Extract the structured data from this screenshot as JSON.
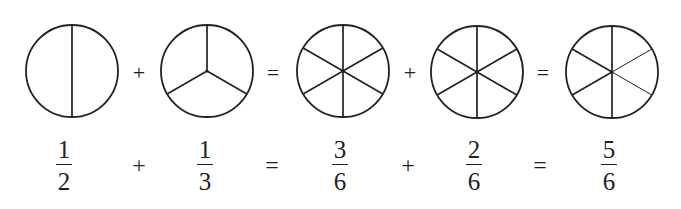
{
  "diagram": {
    "stroke_color": "#222222",
    "background": "#ffffff",
    "circles": [
      {
        "id": "one-half",
        "cx": 72,
        "cy": 71,
        "r": 46,
        "parts": 2,
        "spokes_thick": [
          90,
          270
        ],
        "spokes_thin": []
      },
      {
        "id": "one-third",
        "cx": 207,
        "cy": 71,
        "r": 46,
        "parts": 3,
        "spokes_thick": [
          270,
          30,
          150
        ],
        "spokes_thin": []
      },
      {
        "id": "three-sixths",
        "cx": 343,
        "cy": 71,
        "r": 46,
        "parts": 6,
        "spokes_thick": [
          270,
          330,
          30,
          90,
          150,
          210
        ],
        "spokes_thin": []
      },
      {
        "id": "two-sixths",
        "cx": 477,
        "cy": 72,
        "r": 46,
        "parts": 6,
        "spokes_thick": [
          270,
          330,
          30,
          90,
          150,
          210
        ],
        "spokes_thin": []
      },
      {
        "id": "five-sixths",
        "cx": 612,
        "cy": 72,
        "r": 46,
        "parts": 6,
        "spokes_thick": [
          270,
          90,
          150,
          210
        ],
        "spokes_thin": [
          330,
          30
        ]
      }
    ],
    "top_operators": [
      {
        "symbol": "+",
        "x": 139,
        "y": 80
      },
      {
        "symbol": "=",
        "x": 273,
        "y": 80
      },
      {
        "symbol": "+",
        "x": 410,
        "y": 80
      },
      {
        "symbol": "=",
        "x": 543,
        "y": 80
      }
    ],
    "fractions": [
      {
        "numerator": "1",
        "denominator": "2",
        "x": 64
      },
      {
        "numerator": "1",
        "denominator": "3",
        "x": 205
      },
      {
        "numerator": "3",
        "denominator": "6",
        "x": 340
      },
      {
        "numerator": "2",
        "denominator": "6",
        "x": 474
      },
      {
        "numerator": "5",
        "denominator": "6",
        "x": 609
      }
    ],
    "bottom_operators": [
      {
        "symbol": "+",
        "x": 139
      },
      {
        "symbol": "=",
        "x": 272
      },
      {
        "symbol": "+",
        "x": 408
      },
      {
        "symbol": "=",
        "x": 540
      }
    ],
    "equation_text": "1/2 + 1/3 = 3/6 + 2/6 = 5/6"
  }
}
